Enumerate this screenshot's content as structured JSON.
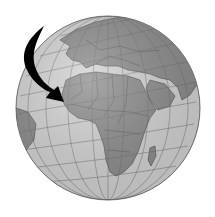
{
  "image": {
    "subject": "globe",
    "view_center": "Africa and Europe",
    "annotation": "arrow pointing to West Africa",
    "colors": {
      "background": "#ffffff",
      "ocean": "#d4d4d4",
      "land": "#8c8c8c",
      "grid": "#6e6e6e",
      "border": "#4a4a4a",
      "arrow": "#000000"
    }
  }
}
